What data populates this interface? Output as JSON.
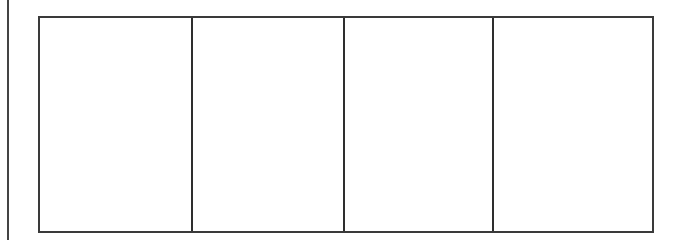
{
  "document": {
    "type": "blank-four-panel-frame",
    "panel_count": 4,
    "panels": [
      {
        "index": 1,
        "content": ""
      },
      {
        "index": 2,
        "content": ""
      },
      {
        "index": 3,
        "content": ""
      },
      {
        "index": 4,
        "content": ""
      }
    ],
    "colors": {
      "background": "#ffffff",
      "border": "#3a3a3a"
    }
  }
}
